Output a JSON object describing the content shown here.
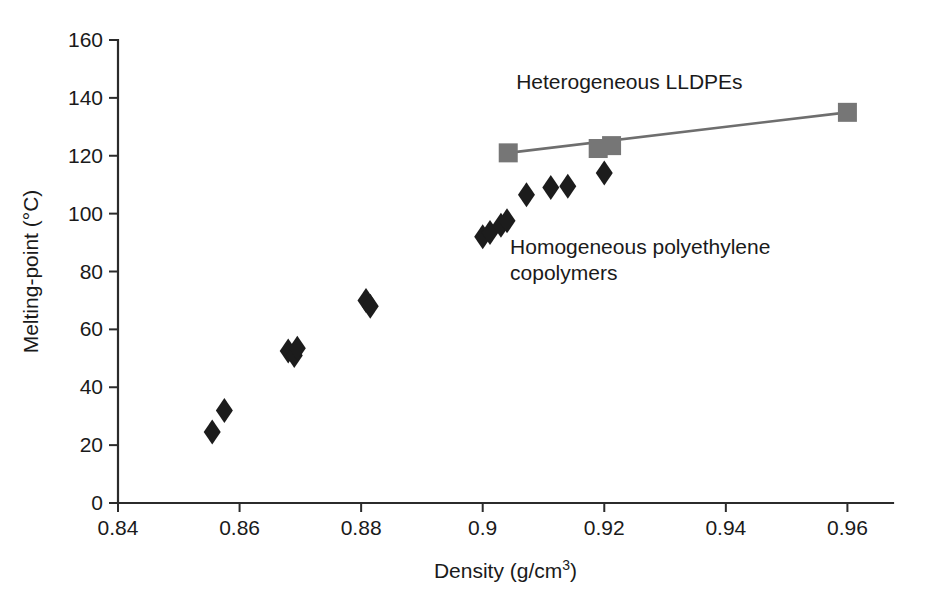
{
  "figure": {
    "title": "",
    "background_color": "#ffffff"
  },
  "axes": {
    "x": {
      "label": "Density (g/cm",
      "label_sup": "3",
      "label_tail": ")",
      "label_full": "Density (g/cm3)",
      "ticks": [
        "0.84",
        "0.86",
        "0.88",
        "0.9",
        "0.92",
        "0.94",
        "0.96"
      ],
      "tick_values": [
        0.84,
        0.86,
        0.88,
        0.9,
        0.92,
        0.94,
        0.96
      ],
      "min": 0.84,
      "max": 0.9675
    },
    "y": {
      "label": "Melting-point (°C)",
      "ticks": [
        "0",
        "20",
        "40",
        "60",
        "80",
        "100",
        "120",
        "140",
        "160"
      ],
      "tick_values": [
        0,
        20,
        40,
        60,
        80,
        100,
        120,
        140,
        160
      ],
      "min": 0,
      "max": 160
    }
  },
  "annotations": [
    {
      "name": "heterogeneous-label",
      "text": "Heterogeneous LLDPEs",
      "x": 0.9055,
      "y": 143,
      "anchor": "start"
    },
    {
      "name": "homogeneous-label-line1",
      "text": "Homogeneous polyethylene",
      "x": 0.9045,
      "y": 86,
      "anchor": "start"
    },
    {
      "name": "homogeneous-label-line2",
      "text": "copolymers",
      "x": 0.9045,
      "y": 77,
      "anchor": "start"
    }
  ],
  "colors": {
    "diamond_marker": "#1c1c1c",
    "square_marker": "#767676",
    "trend_line": "#6e6e6e",
    "axis": "#2b2b2b",
    "text": "#1a1a1a"
  },
  "chart_data": {
    "type": "scatter",
    "title": "",
    "xlabel": "Density (g/cm3)",
    "ylabel": "Melting-point (°C)",
    "xlim": [
      0.84,
      0.9675
    ],
    "ylim": [
      0,
      160
    ],
    "grid": false,
    "legend": "annotation-labels",
    "series": [
      {
        "name": "Homogeneous polyethylene copolymers",
        "marker": "diamond",
        "color": "#1c1c1c",
        "points": [
          {
            "x": 0.8555,
            "y": 24.5
          },
          {
            "x": 0.8575,
            "y": 32.0
          },
          {
            "x": 0.868,
            "y": 52.5
          },
          {
            "x": 0.869,
            "y": 51.0
          },
          {
            "x": 0.8695,
            "y": 53.5
          },
          {
            "x": 0.8808,
            "y": 70.0
          },
          {
            "x": 0.8815,
            "y": 68.0
          },
          {
            "x": 0.9,
            "y": 92.0
          },
          {
            "x": 0.9012,
            "y": 93.5
          },
          {
            "x": 0.903,
            "y": 96.0
          },
          {
            "x": 0.904,
            "y": 97.5
          },
          {
            "x": 0.9072,
            "y": 106.5
          },
          {
            "x": 0.9112,
            "y": 109.0
          },
          {
            "x": 0.914,
            "y": 109.5
          },
          {
            "x": 0.92,
            "y": 114.0
          }
        ]
      },
      {
        "name": "Heterogeneous LLDPEs",
        "marker": "square",
        "color": "#767676",
        "connected": true,
        "points": [
          {
            "x": 0.9042,
            "y": 121.0
          },
          {
            "x": 0.919,
            "y": 122.5
          },
          {
            "x": 0.9212,
            "y": 123.5
          },
          {
            "x": 0.96,
            "y": 135.0
          }
        ],
        "line_points": [
          {
            "x": 0.9042,
            "y": 121.0
          },
          {
            "x": 0.96,
            "y": 135.0
          }
        ]
      }
    ]
  }
}
